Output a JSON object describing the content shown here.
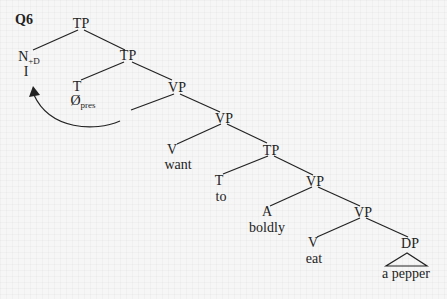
{
  "question_label": "Q6",
  "nodes": {
    "tp_root": "TP",
    "n_cat": "N",
    "n_feature": "+D",
    "n_word": "I",
    "tp_inner": "TP",
    "t_cat": "T",
    "t_word": "Ø",
    "t_sub": "pres",
    "vp1": "VP",
    "vp2": "VP",
    "v_want_cat": "V",
    "v_want_word": "want",
    "tp2": "TP",
    "t2_cat": "T",
    "t2_word": "to",
    "vp3": "VP",
    "a_cat": "A",
    "a_word": "boldly",
    "vp4": "VP",
    "v_eat_cat": "V",
    "v_eat_word": "eat",
    "dp": "DP",
    "dp_word": "a pepper"
  },
  "colors": {
    "line": "#222222",
    "background": "#f6f6f6"
  }
}
